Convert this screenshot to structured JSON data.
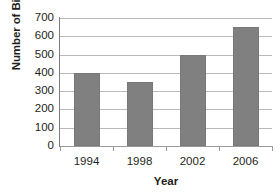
{
  "chart_data": {
    "type": "bar",
    "title": "",
    "categories": [
      "1994",
      "1998",
      "2002",
      "2006"
    ],
    "values": [
      400,
      350,
      500,
      650
    ],
    "series": [
      {
        "name": "Number of Birds",
        "values": [
          400,
          350,
          500,
          650
        ]
      }
    ],
    "xlabel": "Year",
    "ylabel": "Number of Birds",
    "ylim": [
      0,
      700
    ],
    "ytick_values": [
      0,
      100,
      200,
      300,
      400,
      500,
      600,
      700
    ],
    "ytick_labels": [
      "0",
      "100",
      "200",
      "300",
      "400",
      "500",
      "600",
      "700"
    ],
    "grid": true,
    "grid_axis": "y",
    "legend": false,
    "legend_position": "none",
    "bar_color": "#808080",
    "grid_color": "#b9b9b9",
    "axis_color": "#7d7d7d",
    "background_color": "#ffffff",
    "text_color": "#231f20"
  }
}
